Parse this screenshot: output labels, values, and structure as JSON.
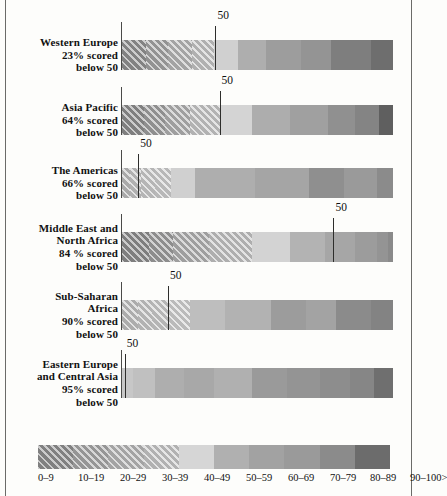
{
  "chart_data": {
    "type": "heatmap",
    "title": "",
    "xlabel": "",
    "ylabel": "",
    "xlim": [
      0,
      100
    ],
    "grid": false,
    "legend_position": "bottom",
    "note": "Horizontal grayscale score-distribution strips by region; hatched light bands denote low score deciles, solid dark gray denotes high score deciles. A vertical tick marks the score-50 position within each region's distribution.",
    "bands": [
      {
        "label": "0–9",
        "color": "#8f8f8f",
        "hatch": true
      },
      {
        "label": "10–19",
        "color": "#a5a5a5",
        "hatch": true
      },
      {
        "label": "20–29",
        "color": "#b4b4b4",
        "hatch": true
      },
      {
        "label": "30–39",
        "color": "#c2c2c2",
        "hatch": true
      },
      {
        "label": "40–49",
        "color": "#d2d2d2",
        "hatch": false
      },
      {
        "label": "50–59",
        "color": "#a8a8a8",
        "hatch": false
      },
      {
        "label": "60–69",
        "color": "#9b9b9b",
        "hatch": false
      },
      {
        "label": "70–79",
        "color": "#8d8d8d",
        "hatch": false
      },
      {
        "label": "80–89",
        "color": "#7f7f7f",
        "hatch": false
      },
      {
        "label": "90–100>",
        "color": "#6a6a6a",
        "hatch": false
      }
    ],
    "categories": [
      "Western Europe",
      "Asia Pacific",
      "The Americas",
      "Middle East and North Africa",
      "Sub-Saharan Africa",
      "Eastern Europe and Central Asia"
    ],
    "series": [
      {
        "name": "percent scored below 50",
        "values": [
          23,
          64,
          66,
          84,
          90,
          95
        ]
      }
    ]
  },
  "rows": [
    {
      "name": "western-europe",
      "label_lines": [
        "Western Europe",
        "23% scored",
        "below 50"
      ],
      "percent_below_50": 23,
      "tick_label": "50",
      "tick_pct": 34.5,
      "segments": [
        {
          "band": "0–9",
          "width_pct": 9,
          "color": "#919191",
          "hatch": true
        },
        {
          "band": "10–19",
          "width_pct": 8,
          "color": "#a3a3a3",
          "hatch": true
        },
        {
          "band": "20–29",
          "width_pct": 9,
          "color": "#b5b5b5",
          "hatch": true
        },
        {
          "band": "30–39",
          "width_pct": 8,
          "color": "#c4c4c4",
          "hatch": true
        },
        {
          "band": "40–49",
          "width_pct": 9,
          "color": "#d0d0d0",
          "hatch": false
        },
        {
          "band": "50–59",
          "width_pct": 10,
          "color": "#aeaeae",
          "hatch": false
        },
        {
          "band": "60–69",
          "width_pct": 13,
          "color": "#9d9d9d",
          "hatch": false
        },
        {
          "band": "70–79",
          "width_pct": 11,
          "color": "#949494",
          "hatch": false
        },
        {
          "band": "80–89",
          "width_pct": 15,
          "color": "#7e7e7e",
          "hatch": false
        },
        {
          "band": "90–100>",
          "width_pct": 8,
          "color": "#6e6e6e",
          "hatch": false
        }
      ]
    },
    {
      "name": "asia-pacific",
      "label_lines": [
        "Asia Pacific",
        "64% scored",
        "below 50"
      ],
      "percent_below_50": 64,
      "tick_label": "50",
      "tick_pct": 36,
      "segments": [
        {
          "band": "0–9",
          "width_pct": 8,
          "color": "#8d8d8d",
          "hatch": true
        },
        {
          "band": "10–19",
          "width_pct": 8,
          "color": "#9f9f9f",
          "hatch": true
        },
        {
          "band": "20–29",
          "width_pct": 9,
          "color": "#b1b1b1",
          "hatch": true
        },
        {
          "band": "30–39",
          "width_pct": 11,
          "color": "#c6c6c6",
          "hatch": true
        },
        {
          "band": "40–49",
          "width_pct": 12,
          "color": "#d4d4d4",
          "hatch": false
        },
        {
          "band": "50–59",
          "width_pct": 14,
          "color": "#adadad",
          "hatch": false
        },
        {
          "band": "60–69",
          "width_pct": 14,
          "color": "#a0a0a0",
          "hatch": false
        },
        {
          "band": "70–79",
          "width_pct": 10,
          "color": "#909090",
          "hatch": false
        },
        {
          "band": "80–89",
          "width_pct": 9,
          "color": "#848484",
          "hatch": false
        },
        {
          "band": "90–100>",
          "width_pct": 5,
          "color": "#5f5f5f",
          "hatch": false
        }
      ]
    },
    {
      "name": "the-americas",
      "label_lines": [
        "The Americas",
        "66% scored",
        "below 50"
      ],
      "percent_below_50": 66,
      "tick_label": "50",
      "tick_pct": 6,
      "segments": [
        {
          "band": "0–9",
          "width_pct": 3,
          "color": "#bcbcbc",
          "hatch": true
        },
        {
          "band": "10–19",
          "width_pct": 4,
          "color": "#c4c4c4",
          "hatch": true
        },
        {
          "band": "20–29",
          "width_pct": 5,
          "color": "#c9c9c9",
          "hatch": true
        },
        {
          "band": "30–39",
          "width_pct": 6,
          "color": "#cdcdcd",
          "hatch": true
        },
        {
          "band": "40–49",
          "width_pct": 9,
          "color": "#d0d0d0",
          "hatch": false
        },
        {
          "band": "50–59",
          "width_pct": 22,
          "color": "#aeaeae",
          "hatch": false
        },
        {
          "band": "60–69",
          "width_pct": 20,
          "color": "#a5a5a5",
          "hatch": false
        },
        {
          "band": "70–79",
          "width_pct": 13,
          "color": "#8f8f8f",
          "hatch": false
        },
        {
          "band": "80–89",
          "width_pct": 12,
          "color": "#9a9a9a",
          "hatch": false
        },
        {
          "band": "90–100>",
          "width_pct": 6,
          "color": "#8b8b8b",
          "hatch": false
        }
      ]
    },
    {
      "name": "middle-east-and-north-africa",
      "label_lines": [
        "Middle East and",
        "North Africa",
        "84 % scored",
        "below 50"
      ],
      "percent_below_50": 84,
      "tick_label": "50",
      "tick_pct": 78,
      "segments": [
        {
          "band": "0–9",
          "width_pct": 10,
          "color": "#8c8c8c",
          "hatch": true
        },
        {
          "band": "10–19",
          "width_pct": 9,
          "color": "#9d9d9d",
          "hatch": true
        },
        {
          "band": "20–29",
          "width_pct": 13,
          "color": "#b0b0b0",
          "hatch": true
        },
        {
          "band": "30–39",
          "width_pct": 16,
          "color": "#c2c2c2",
          "hatch": true
        },
        {
          "band": "40–49",
          "width_pct": 14,
          "color": "#d3d3d3",
          "hatch": false
        },
        {
          "band": "50–59",
          "width_pct": 13,
          "color": "#b3b3b3",
          "hatch": false
        },
        {
          "band": "60–69",
          "width_pct": 11,
          "color": "#a6a6a6",
          "hatch": false
        },
        {
          "band": "70–79",
          "width_pct": 8,
          "color": "#9c9c9c",
          "hatch": false
        },
        {
          "band": "80–89",
          "width_pct": 4,
          "color": "#949494",
          "hatch": false
        },
        {
          "band": "90–100>",
          "width_pct": 2,
          "color": "#8a8a8a",
          "hatch": false
        }
      ]
    },
    {
      "name": "sub-saharan-africa",
      "label_lines": [
        "Sub-Saharan",
        "Africa",
        "90% scored",
        "below 50"
      ],
      "percent_below_50": 90,
      "tick_label": "50",
      "tick_pct": 17,
      "segments": [
        {
          "band": "0–9",
          "width_pct": 6,
          "color": "#c0c0c0",
          "hatch": true
        },
        {
          "band": "10–19",
          "width_pct": 5,
          "color": "#c6c6c6",
          "hatch": true
        },
        {
          "band": "20–29",
          "width_pct": 6,
          "color": "#cacaca",
          "hatch": true
        },
        {
          "band": "30–39",
          "width_pct": 8,
          "color": "#cfcfcf",
          "hatch": true
        },
        {
          "band": "40–49",
          "width_pct": 13,
          "color": "#bebebe",
          "hatch": false
        },
        {
          "band": "50–59",
          "width_pct": 17,
          "color": "#b2b2b2",
          "hatch": false
        },
        {
          "band": "60–69",
          "width_pct": 13,
          "color": "#9c9c9c",
          "hatch": false
        },
        {
          "band": "70–79",
          "width_pct": 11,
          "color": "#a3a3a3",
          "hatch": false
        },
        {
          "band": "80–89",
          "width_pct": 13,
          "color": "#8b8b8b",
          "hatch": false
        },
        {
          "band": "90–100>",
          "width_pct": 8,
          "color": "#838383",
          "hatch": false
        }
      ]
    },
    {
      "name": "eastern-europe-and-central-asia",
      "label_lines": [
        "Eastern Europe",
        "and Central Asia",
        "95% scored",
        "below 50"
      ],
      "percent_below_50": 95,
      "tick_label": "50",
      "tick_pct": 1,
      "segments": [
        {
          "band": "0–9",
          "width_pct": 4,
          "color": "#c7c7c7",
          "hatch": false
        },
        {
          "band": "10–19",
          "width_pct": 8,
          "color": "#c0c0c0",
          "hatch": false
        },
        {
          "band": "20–29",
          "width_pct": 11,
          "color": "#aeaeae",
          "hatch": false
        },
        {
          "band": "30–39",
          "width_pct": 11,
          "color": "#a8a8a8",
          "hatch": false
        },
        {
          "band": "40–49",
          "width_pct": 14,
          "color": "#b0b0b0",
          "hatch": false
        },
        {
          "band": "50–59",
          "width_pct": 13,
          "color": "#9a9a9a",
          "hatch": false
        },
        {
          "band": "60–69",
          "width_pct": 12,
          "color": "#949494",
          "hatch": false
        },
        {
          "band": "70–79",
          "width_pct": 11,
          "color": "#8d8d8d",
          "hatch": false
        },
        {
          "band": "80–89",
          "width_pct": 9,
          "color": "#868686",
          "hatch": false
        },
        {
          "band": "90–100>",
          "width_pct": 7,
          "color": "#6f6f6f",
          "hatch": false
        }
      ]
    }
  ],
  "legend": {
    "labels": [
      "0–9",
      "10–19",
      "20–29",
      "30–39",
      "40–49",
      "50–59",
      "60–69",
      "70–79",
      "80–89",
      "90–100>"
    ],
    "segments": [
      {
        "color": "#8e8e8e",
        "hatch": true
      },
      {
        "color": "#a6a6a6",
        "hatch": true
      },
      {
        "color": "#b6b6b6",
        "hatch": true
      },
      {
        "color": "#c5c5c5",
        "hatch": true
      },
      {
        "color": "#d6d6d6",
        "hatch": false
      },
      {
        "color": "#b0b0b0",
        "hatch": false
      },
      {
        "color": "#a2a2a2",
        "hatch": false
      },
      {
        "color": "#9a9a9a",
        "hatch": false
      },
      {
        "color": "#8b8b8b",
        "hatch": false
      },
      {
        "color": "#6c6c6c",
        "hatch": false
      }
    ]
  }
}
